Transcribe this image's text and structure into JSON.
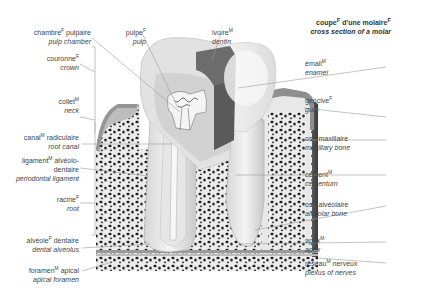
{
  "title": {
    "fr": "coupe",
    "fr_sup1": "F",
    "fr_mid": " d'une molaire",
    "fr_sup2": "F",
    "en": "cross section of a molar"
  },
  "labels": {
    "pulp_chamber": {
      "fr": "chambre",
      "gender": "F",
      "fr_rest": " pulpaire",
      "en": "pulp chamber"
    },
    "pulp": {
      "fr": "pulpe",
      "gender": "F",
      "fr_rest": "",
      "en": "pulp"
    },
    "dentin": {
      "fr": "ivoire",
      "gender": "M",
      "fr_rest": "",
      "en": "dentin"
    },
    "crown": {
      "fr": "couronne",
      "gender": "F",
      "fr_rest": "",
      "en": "crown"
    },
    "neck": {
      "fr": "collet",
      "gender": "M",
      "fr_rest": "",
      "en": "neck"
    },
    "root_canal": {
      "fr": "canal",
      "gender": "M",
      "fr_rest": " radiculaire",
      "en": "root canal"
    },
    "periodontal_ligament": {
      "fr": "ligament",
      "gender": "M",
      "fr_rest": " alvéolo-",
      "fr_line2": "dentaire",
      "en": "periodontal ligament"
    },
    "root": {
      "fr": "racine",
      "gender": "F",
      "fr_rest": "",
      "en": "root"
    },
    "dental_alveolus": {
      "fr": "alvéole",
      "gender": "F",
      "fr_rest": " dentaire",
      "en": "dental alveolus"
    },
    "apical_foramen": {
      "fr": "foramen",
      "gender": "M",
      "fr_rest": " apical",
      "en": "apical foramen"
    },
    "enamel": {
      "fr": "émail",
      "gender": "M",
      "fr_rest": "",
      "en": "enamel"
    },
    "gum": {
      "fr": "gencive",
      "gender": "F",
      "fr_rest": "",
      "en": "gum"
    },
    "maxillary_bone": {
      "fr": "os",
      "gender": "M",
      "fr_rest": " maxillaire",
      "en": "maxillary bone"
    },
    "cementum": {
      "fr": "cément",
      "gender": "M",
      "fr_rest": "",
      "en": "cementum"
    },
    "alveolar_bone": {
      "fr": "os",
      "gender": "M",
      "fr_rest": " alvéolaire",
      "en": "alveolar bone"
    },
    "apex": {
      "fr": "apex",
      "gender": "M",
      "fr_rest": "",
      "en": "apex"
    },
    "plexus_of_nerves": {
      "fr": "réseau",
      "gender": "M",
      "fr_rest": " nerveux",
      "en": "plexus of nerves"
    }
  },
  "colors": {
    "text": "#444444",
    "leader": "#9a9a9a",
    "bone": "#e4e4e4",
    "bone_dots": "#222222",
    "enamel": "#f2f2f2",
    "dentin": "#d8d8d8",
    "dentin_dark": "#6e6e6e",
    "pulp": "#eaeaea",
    "gum": "#9c9c9c"
  }
}
